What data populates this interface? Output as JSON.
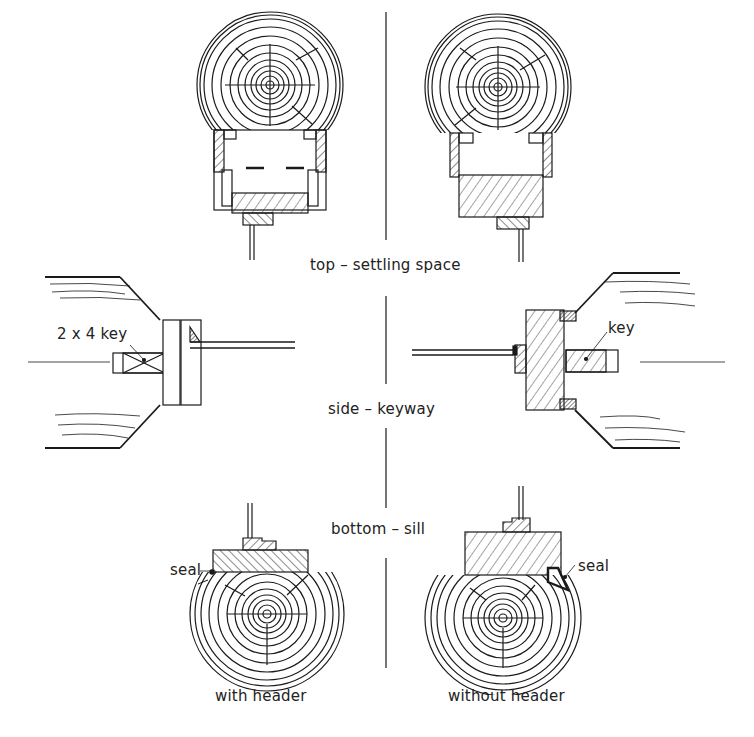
{
  "diagram": {
    "section_labels": {
      "top": "top – settling space",
      "side": "side – keyway",
      "bottom": "bottom – sill"
    },
    "column_labels": {
      "left": "with header",
      "right": "without header"
    },
    "callouts": {
      "left_key": "2 x 4 key",
      "right_key": "key",
      "left_seal": "seal",
      "right_seal": "seal"
    },
    "colors": {
      "line": "#1a1a1a",
      "background": "#ffffff",
      "text": "#222222"
    }
  }
}
